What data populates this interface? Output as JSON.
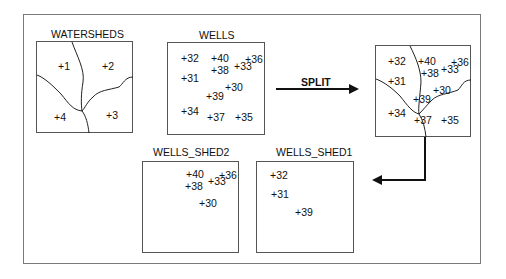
{
  "diagram": {
    "operation_label": "SPLIT",
    "panels": {
      "watersheds": {
        "title": "WATERSHEDS",
        "points": [
          {
            "id": "ws-1",
            "label": "+1"
          },
          {
            "id": "ws-2",
            "label": "+2"
          },
          {
            "id": "ws-3",
            "label": "+3"
          },
          {
            "id": "ws-4",
            "label": "+4"
          }
        ]
      },
      "wells": {
        "title": "WELLS",
        "points": [
          {
            "id": "w-32",
            "label": "+32"
          },
          {
            "id": "w-40",
            "label": "+40"
          },
          {
            "id": "w-36",
            "label": "+36"
          },
          {
            "id": "w-33",
            "label": "+33"
          },
          {
            "id": "w-38",
            "label": "+38"
          },
          {
            "id": "w-31",
            "label": "+31"
          },
          {
            "id": "w-30",
            "label": "+30"
          },
          {
            "id": "w-39",
            "label": "+39"
          },
          {
            "id": "w-34",
            "label": "+34"
          },
          {
            "id": "w-37",
            "label": "+37"
          },
          {
            "id": "w-35",
            "label": "+35"
          }
        ]
      },
      "overlay": {
        "title": "",
        "points": [
          {
            "id": "o-32",
            "label": "+32"
          },
          {
            "id": "o-40",
            "label": "+40"
          },
          {
            "id": "o-36",
            "label": "+36"
          },
          {
            "id": "o-33",
            "label": "+33"
          },
          {
            "id": "o-38",
            "label": "+38"
          },
          {
            "id": "o-31",
            "label": "+31"
          },
          {
            "id": "o-30",
            "label": "+30"
          },
          {
            "id": "o-39",
            "label": "+39"
          },
          {
            "id": "o-34",
            "label": "+34"
          },
          {
            "id": "o-37",
            "label": "+37"
          },
          {
            "id": "o-35",
            "label": "+35"
          }
        ]
      },
      "wells_shed2": {
        "title": "WELLS_SHED2",
        "points": [
          {
            "id": "s2-40",
            "label": "+40"
          },
          {
            "id": "s2-36",
            "label": "+36"
          },
          {
            "id": "s2-33",
            "label": "+33"
          },
          {
            "id": "s2-38",
            "label": "+38"
          },
          {
            "id": "s2-30",
            "label": "+30"
          }
        ]
      },
      "wells_shed1": {
        "title": "WELLS_SHED1",
        "points": [
          {
            "id": "s1-32",
            "label": "+32"
          },
          {
            "id": "s1-31",
            "label": "+31"
          },
          {
            "id": "s1-39",
            "label": "+39"
          }
        ]
      }
    }
  }
}
